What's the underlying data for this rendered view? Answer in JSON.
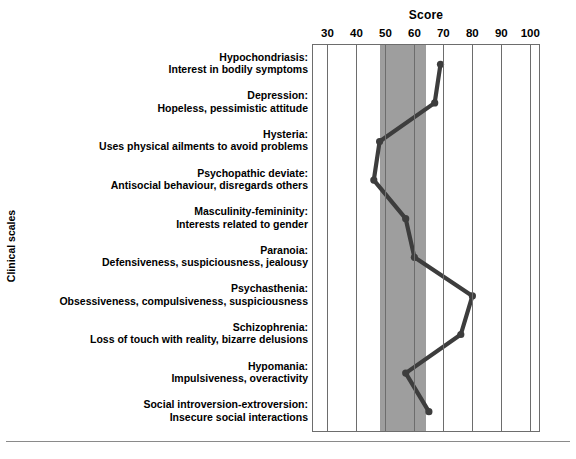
{
  "chart_data": {
    "type": "line",
    "orientation": "horizontal",
    "title": "Score",
    "xlabel": "Score",
    "ylabel": "Clinical scales",
    "xlim": [
      25,
      103
    ],
    "xticks": [
      30,
      40,
      50,
      60,
      70,
      80,
      90,
      100
    ],
    "xtick_labels": [
      "30",
      "40",
      "50",
      "60",
      "70",
      "80",
      "90",
      "100"
    ],
    "grid": true,
    "legend": "none",
    "normal_band": {
      "label": "normal range",
      "from": 48,
      "to": 64,
      "color": "#9e9e9e"
    },
    "line_color": "#3d3d3d",
    "marker": "circle",
    "categories": [
      "Hypochondriasis",
      "Depression",
      "Hysteria",
      "Psychopathic deviate",
      "Masculinity-femininity",
      "Paranoia",
      "Psychasthenia",
      "Schizophrenia",
      "Hypomania",
      "Social introversion-extroversion"
    ],
    "values": [
      69,
      67,
      48,
      46,
      57,
      60,
      80,
      76,
      57,
      65
    ],
    "points": [
      {
        "scale": "Hypochondriasis",
        "description": "Interest in bodily symptoms",
        "score": 69
      },
      {
        "scale": "Depression",
        "description": "Hopeless, pessimistic attitude",
        "score": 67
      },
      {
        "scale": "Hysteria",
        "description": "Uses physical ailments to avoid problems",
        "score": 48
      },
      {
        "scale": "Psychopathic deviate",
        "description": "Antisocial behaviour, disregards others",
        "score": 46
      },
      {
        "scale": "Masculinity-femininity",
        "description": "Interests related to gender",
        "score": 57
      },
      {
        "scale": "Paranoia",
        "description": "Defensiveness, suspiciousness, jealousy",
        "score": 60
      },
      {
        "scale": "Psychasthenia",
        "description": "Obsessiveness, compulsiveness, suspiciousness",
        "score": 80
      },
      {
        "scale": "Schizophrenia",
        "description": "Loss of touch with reality, bizarre delusions",
        "score": 76
      },
      {
        "scale": "Hypomania",
        "description": "Impulsiveness, overactivity",
        "score": 57
      },
      {
        "scale": "Social introversion-extroversion",
        "description": "Insecure social interactions",
        "score": 65
      }
    ]
  },
  "axis": {
    "title": "Score",
    "y_caption": "Clinical scales",
    "ticks": [
      "30",
      "40",
      "50",
      "60",
      "70",
      "80",
      "90",
      "100"
    ]
  },
  "rows": [
    {
      "name": "Hypochondriasis:",
      "desc": "Interest in bodily symptoms"
    },
    {
      "name": "Depression:",
      "desc": "Hopeless, pessimistic attitude"
    },
    {
      "name": "Hysteria:",
      "desc": "Uses physical ailments to avoid problems"
    },
    {
      "name": "Psychopathic deviate:",
      "desc": "Antisocial behaviour, disregards others"
    },
    {
      "name": "Masculinity-femininity:",
      "desc": "Interests related to gender"
    },
    {
      "name": "Paranoia:",
      "desc": "Defensiveness, suspiciousness, jealousy"
    },
    {
      "name": "Psychasthenia:",
      "desc": "Obsessiveness, compulsiveness, suspiciousness"
    },
    {
      "name": "Schizophrenia:",
      "desc": "Loss of touch with reality, bizarre delusions"
    },
    {
      "name": "Hypomania:",
      "desc": "Impulsiveness, overactivity"
    },
    {
      "name": "Social introversion-extroversion:",
      "desc": "Insecure social interactions"
    }
  ],
  "colors": {
    "band": "#9e9e9e",
    "grid": "#6d6d6d",
    "line": "#3d3d3d",
    "text": "#000000",
    "background": "#ffffff"
  }
}
